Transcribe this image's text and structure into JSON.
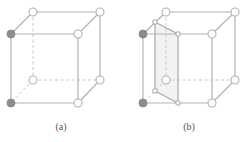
{
  "figure": {
    "panels": [
      {
        "id": "a",
        "label": "(a)",
        "label_pos": [
          61,
          130
        ],
        "nodes": {
          "back_top_left": {
            "x": 33,
            "y": 12,
            "filled": false
          },
          "back_top_right": {
            "x": 100,
            "y": 12,
            "filled": false
          },
          "front_top_left": {
            "x": 11,
            "y": 34,
            "filled": true
          },
          "front_top_right": {
            "x": 78,
            "y": 34,
            "filled": false
          },
          "back_bot_left": {
            "x": 33,
            "y": 80,
            "filled": false
          },
          "back_bot_right": {
            "x": 100,
            "y": 80,
            "filled": false
          },
          "front_bot_left": {
            "x": 11,
            "y": 103,
            "filled": true
          },
          "front_bot_right": {
            "x": 78,
            "y": 103,
            "filled": false
          }
        }
      },
      {
        "id": "b",
        "label": "(b)",
        "label_pos": [
          189,
          130
        ],
        "nodes": {
          "back_top_left": {
            "x": 166,
            "y": 12,
            "filled": false
          },
          "back_top_right": {
            "x": 235,
            "y": 12,
            "filled": false
          },
          "front_top_left": {
            "x": 143,
            "y": 34,
            "filled": true
          },
          "front_top_right": {
            "x": 212,
            "y": 34,
            "filled": false
          },
          "back_bot_left": {
            "x": 166,
            "y": 80,
            "filled": false
          },
          "back_bot_right": {
            "x": 235,
            "y": 80,
            "filled": false
          },
          "front_bot_left": {
            "x": 143,
            "y": 103,
            "filled": true
          },
          "front_bot_right": {
            "x": 212,
            "y": 103,
            "filled": false
          }
        },
        "plane": {
          "top_back": {
            "x": 155,
            "y": 22
          },
          "top_front": {
            "x": 178,
            "y": 34
          },
          "bot_front": {
            "x": 178,
            "y": 103
          },
          "bot_back": {
            "x": 155,
            "y": 91
          },
          "fill": "#f2f2f2"
        }
      }
    ],
    "colors": {
      "edge": "#b4b4b4",
      "filled_node": "#8c8c8c",
      "open_node_stroke": "#b0b0b0",
      "label": "#555555"
    }
  }
}
